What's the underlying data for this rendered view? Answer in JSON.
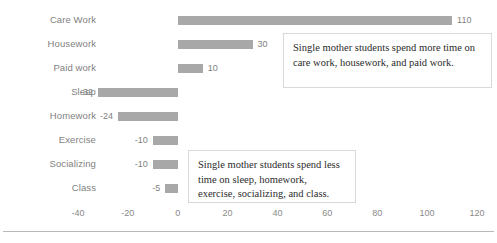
{
  "chart_data": {
    "type": "bar",
    "orientation": "horizontal",
    "title": "",
    "xlabel": "",
    "ylabel": "",
    "categories": [
      "Care Work",
      "Housework",
      "Paid work",
      "Sleep",
      "Homework",
      "Exercise",
      "Socializing",
      "Class"
    ],
    "values": [
      110,
      30,
      10,
      -32,
      -24,
      -10,
      -10,
      -5
    ],
    "data_labels": [
      "110",
      "30",
      "10",
      "-32",
      "-24",
      "-10",
      "-10",
      "-5"
    ],
    "xlim": [
      -40,
      120
    ],
    "xticks": [
      -40,
      -20,
      0,
      20,
      40,
      60,
      80,
      100,
      120
    ],
    "xtick_labels": [
      "-40",
      "-20",
      "0",
      "20",
      "40",
      "60",
      "80",
      "100",
      "120"
    ],
    "grid": false,
    "legend": null,
    "bar_color": "#a8a8a8",
    "label_color": "#7f7f7f",
    "annotations": [
      {
        "name": "more-time-callout",
        "text": "Single mother students spend more time on care work, housework, and paid work."
      },
      {
        "name": "less-time-callout",
        "text": "Single mother students spend less time on sleep, homework, exercise, socializing, and class."
      }
    ]
  }
}
